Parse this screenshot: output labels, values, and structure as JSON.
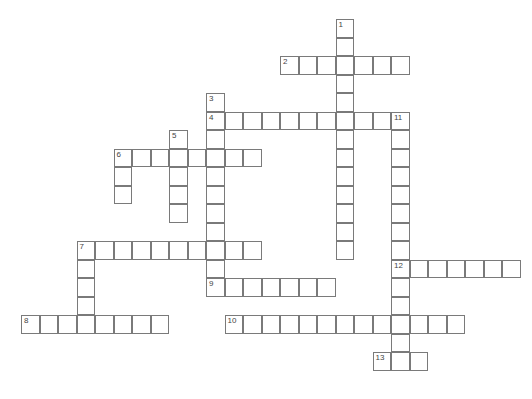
{
  "puzzle": {
    "type": "crossword",
    "cell_size": 18.5,
    "origin": {
      "x": 21,
      "y": 19
    },
    "entries": [
      {
        "number": "1",
        "direction": "down",
        "row": 0,
        "col": 17,
        "length": 13
      },
      {
        "number": "2",
        "direction": "across",
        "row": 2,
        "col": 14,
        "length": 7
      },
      {
        "number": "3",
        "direction": "down",
        "row": 4,
        "col": 10,
        "length": 11
      },
      {
        "number": "4",
        "direction": "across",
        "row": 5,
        "col": 10,
        "length": 11
      },
      {
        "number": "5",
        "direction": "down",
        "row": 6,
        "col": 8,
        "length": 5
      },
      {
        "number": "6",
        "direction": "across",
        "row": 7,
        "col": 5,
        "length": 8
      },
      {
        "number": "6",
        "direction": "down",
        "row": 7,
        "col": 5,
        "length": 3
      },
      {
        "number": "7",
        "direction": "across",
        "row": 12,
        "col": 3,
        "length": 10
      },
      {
        "number": "7",
        "direction": "down",
        "row": 12,
        "col": 3,
        "length": 5
      },
      {
        "number": "8",
        "direction": "across",
        "row": 16,
        "col": 0,
        "length": 8
      },
      {
        "number": "9",
        "direction": "across",
        "row": 14,
        "col": 10,
        "length": 7
      },
      {
        "number": "10",
        "direction": "across",
        "row": 16,
        "col": 11,
        "length": 13
      },
      {
        "number": "11",
        "direction": "down",
        "row": 5,
        "col": 20,
        "length": 14
      },
      {
        "number": "12",
        "direction": "across",
        "row": 13,
        "col": 20,
        "length": 7
      },
      {
        "number": "13",
        "direction": "across",
        "row": 18,
        "col": 19,
        "length": 3
      }
    ]
  }
}
